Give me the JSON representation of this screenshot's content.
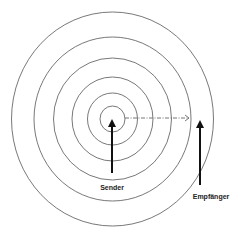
{
  "diagram": {
    "title": "",
    "center": {
      "x": 112.5,
      "y": 119
    },
    "rings": [
      {
        "rx": 12.5,
        "ry": 13
      },
      {
        "rx": 25,
        "ry": 26
      },
      {
        "rx": 40.5,
        "ry": 42
      },
      {
        "rx": 59,
        "ry": 61
      },
      {
        "rx": 78.5,
        "ry": 82
      },
      {
        "rx": 101,
        "ry": 107
      }
    ],
    "ring_color": "#555555",
    "sender": {
      "label": "Sender",
      "arrow": {
        "x": 112,
        "y_tip": 119,
        "y_base": 173
      },
      "label_pos": {
        "x": 112,
        "y": 190
      }
    },
    "receiver": {
      "label": "Empfänger",
      "arrow": {
        "x": 200,
        "y_tip": 120,
        "y_base": 185
      },
      "label_pos": {
        "x": 211,
        "y": 199
      }
    },
    "propagation_arrow": {
      "x1": 125,
      "x2": 189,
      "y": 118,
      "style": "dash-dot",
      "color": "#666666"
    },
    "arrow_color": "#111111"
  }
}
